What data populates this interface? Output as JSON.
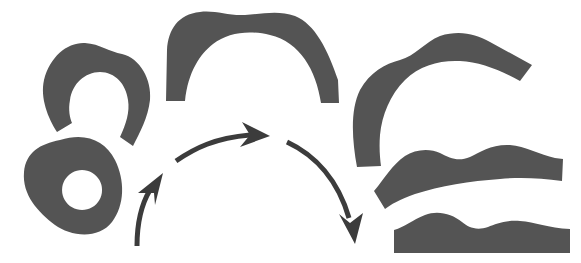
{
  "diagram": {
    "title": "",
    "colors": {
      "background": "#ffffff",
      "shape_fill": "#545454",
      "arrow": "#3c3c3c"
    },
    "stages": [
      {
        "id": 1,
        "name": "closed ring with hole"
      },
      {
        "id": 2,
        "name": "opened horseshoe"
      },
      {
        "id": 3,
        "name": "wide arch"
      },
      {
        "id": 4,
        "name": "tilted shallow arch"
      },
      {
        "id": 5,
        "name": "nearly flat wavy strip"
      },
      {
        "id": 6,
        "name": "flat wavy strip"
      }
    ],
    "arrows": [
      {
        "from": "lower-left",
        "to": "upper-middle",
        "direction": "up"
      },
      {
        "from": "middle-left",
        "to": "middle-right",
        "direction": "right"
      },
      {
        "from": "middle-right",
        "to": "lower-right",
        "direction": "down"
      }
    ]
  }
}
